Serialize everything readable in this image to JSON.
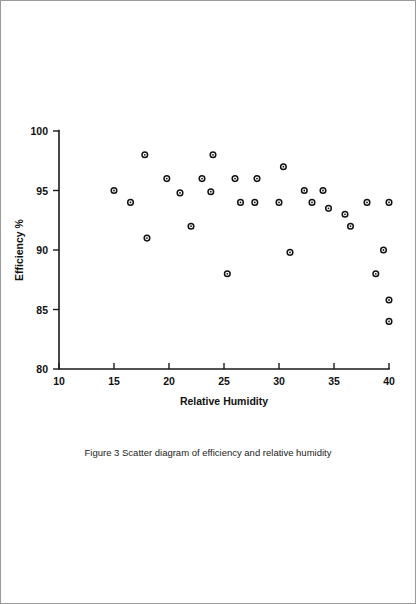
{
  "figure": {
    "caption": "Figure 3  Scatter diagram of efficiency and relative humidity",
    "caption_number": "Figure 3"
  },
  "chart_data": {
    "type": "scatter",
    "title": "",
    "xlabel": "Relative Humidity",
    "ylabel": "Efficiency %",
    "xlim": [
      10,
      40
    ],
    "ylim": [
      80,
      100
    ],
    "xticks": [
      10,
      15,
      20,
      25,
      30,
      35,
      40
    ],
    "xtick_labels": [
      "10",
      "15",
      "20",
      "25",
      "30",
      "35",
      "40"
    ],
    "yticks": [
      80,
      85,
      90,
      95,
      100
    ],
    "ytick_labels": [
      "80",
      "85",
      "90",
      "95",
      "100"
    ],
    "grid": false,
    "legend": null,
    "marker": "open-circle",
    "marker_color": "#111111",
    "n_points": 30,
    "points": [
      {
        "x": 15.0,
        "y": 95.0
      },
      {
        "x": 16.5,
        "y": 94.0
      },
      {
        "x": 17.8,
        "y": 98.0
      },
      {
        "x": 18.0,
        "y": 91.0
      },
      {
        "x": 19.8,
        "y": 96.0
      },
      {
        "x": 21.0,
        "y": 94.8
      },
      {
        "x": 22.0,
        "y": 92.0
      },
      {
        "x": 23.0,
        "y": 96.0
      },
      {
        "x": 23.8,
        "y": 94.9
      },
      {
        "x": 24.0,
        "y": 98.0
      },
      {
        "x": 25.3,
        "y": 88.0
      },
      {
        "x": 26.0,
        "y": 96.0
      },
      {
        "x": 26.5,
        "y": 94.0
      },
      {
        "x": 27.8,
        "y": 94.0
      },
      {
        "x": 28.0,
        "y": 96.0
      },
      {
        "x": 30.0,
        "y": 94.0
      },
      {
        "x": 30.4,
        "y": 97.0
      },
      {
        "x": 31.0,
        "y": 89.8
      },
      {
        "x": 32.3,
        "y": 95.0
      },
      {
        "x": 33.0,
        "y": 94.0
      },
      {
        "x": 34.0,
        "y": 95.0
      },
      {
        "x": 34.5,
        "y": 93.5
      },
      {
        "x": 36.0,
        "y": 93.0
      },
      {
        "x": 36.5,
        "y": 92.0
      },
      {
        "x": 38.0,
        "y": 94.0
      },
      {
        "x": 38.8,
        "y": 88.0
      },
      {
        "x": 39.5,
        "y": 90.0
      },
      {
        "x": 40.0,
        "y": 94.0
      },
      {
        "x": 40.0,
        "y": 85.8
      },
      {
        "x": 40.0,
        "y": 84.0
      }
    ]
  }
}
